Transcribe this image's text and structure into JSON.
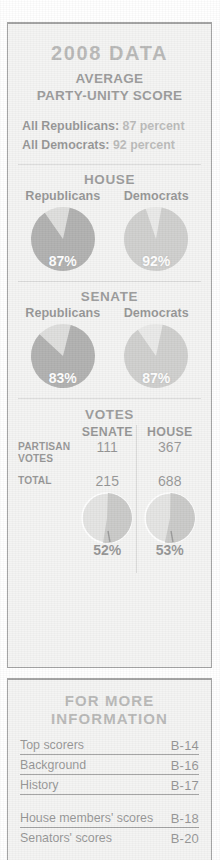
{
  "header": {
    "title": "2008 DATA",
    "subtitle_line1": "AVERAGE",
    "subtitle_line2": "PARTY-UNITY SCORE"
  },
  "summary": {
    "rows": [
      {
        "label": "All Republicans:",
        "value": "87 percent"
      },
      {
        "label": "All Democrats:",
        "value": "92 percent"
      }
    ]
  },
  "chambers": [
    {
      "name": "HOUSE",
      "parties": [
        {
          "name": "Republicans",
          "label": "87%",
          "value": 87
        },
        {
          "name": "Democrats",
          "label": "92%",
          "value": 92
        }
      ]
    },
    {
      "name": "SENATE",
      "parties": [
        {
          "name": "Republicans",
          "label": "83%",
          "value": 83
        },
        {
          "name": "Democrats",
          "label": "87%",
          "value": 87
        }
      ]
    }
  ],
  "votes": {
    "title": "VOTES",
    "columns": [
      "SENATE",
      "HOUSE"
    ],
    "rows": [
      {
        "label_line1": "PARTISAN",
        "label_line2": "VOTES",
        "senate": "111",
        "house": "367"
      },
      {
        "label_line1": "TOTAL",
        "label_line2": "",
        "senate": "215",
        "house": "688"
      }
    ],
    "pies": [
      {
        "chamber": "SENATE",
        "label": "52%",
        "value": 52
      },
      {
        "chamber": "HOUSE",
        "label": "53%",
        "value": 53
      }
    ]
  },
  "info": {
    "title_line1": "FOR MORE",
    "title_line2": "INFORMATION",
    "items": [
      {
        "name": "Top scorers",
        "page": "B-14"
      },
      {
        "name": "Background",
        "page": "B-16"
      },
      {
        "name": "History",
        "page": "B-17"
      },
      {
        "name": "House members' scores",
        "page": "B-18"
      },
      {
        "name": "Senators' scores",
        "page": "B-20"
      }
    ]
  },
  "chart_data": [
    {
      "type": "pie",
      "title": "HOUSE Republicans party-unity score",
      "categories": [
        "Party-unity votes",
        "Other"
      ],
      "values": [
        87,
        13
      ],
      "colors": [
        "#5a5a58",
        "#b9b9b6"
      ],
      "data_label": "87%"
    },
    {
      "type": "pie",
      "title": "HOUSE Democrats party-unity score",
      "categories": [
        "Party-unity votes",
        "Other"
      ],
      "values": [
        92,
        8
      ],
      "colors": [
        "#9a9a97",
        "#d2d2cf"
      ],
      "data_label": "92%"
    },
    {
      "type": "pie",
      "title": "SENATE Republicans party-unity score",
      "categories": [
        "Party-unity votes",
        "Other"
      ],
      "values": [
        83,
        17
      ],
      "colors": [
        "#5a5a58",
        "#b9b9b6"
      ],
      "data_label": "83%"
    },
    {
      "type": "pie",
      "title": "SENATE Democrats party-unity score",
      "categories": [
        "Party-unity votes",
        "Other"
      ],
      "values": [
        87,
        13
      ],
      "colors": [
        "#9a9a97",
        "#d2d2cf"
      ],
      "data_label": "87%"
    },
    {
      "type": "pie",
      "title": "Senate partisan votes as share of total",
      "categories": [
        "Partisan votes",
        "Other votes"
      ],
      "values": [
        52,
        48
      ],
      "colors": [
        "#8f8f8c",
        "#c6c6c3"
      ],
      "data_label": "52%"
    },
    {
      "type": "pie",
      "title": "House partisan votes as share of total",
      "categories": [
        "Partisan votes",
        "Other votes"
      ],
      "values": [
        53,
        47
      ],
      "colors": [
        "#8f8f8c",
        "#c6c6c3"
      ],
      "data_label": "53%"
    },
    {
      "type": "table",
      "title": "VOTES",
      "columns": [
        "",
        "SENATE",
        "HOUSE"
      ],
      "rows": [
        [
          "PARTISAN VOTES",
          111,
          367
        ],
        [
          "TOTAL",
          215,
          688
        ]
      ]
    }
  ]
}
